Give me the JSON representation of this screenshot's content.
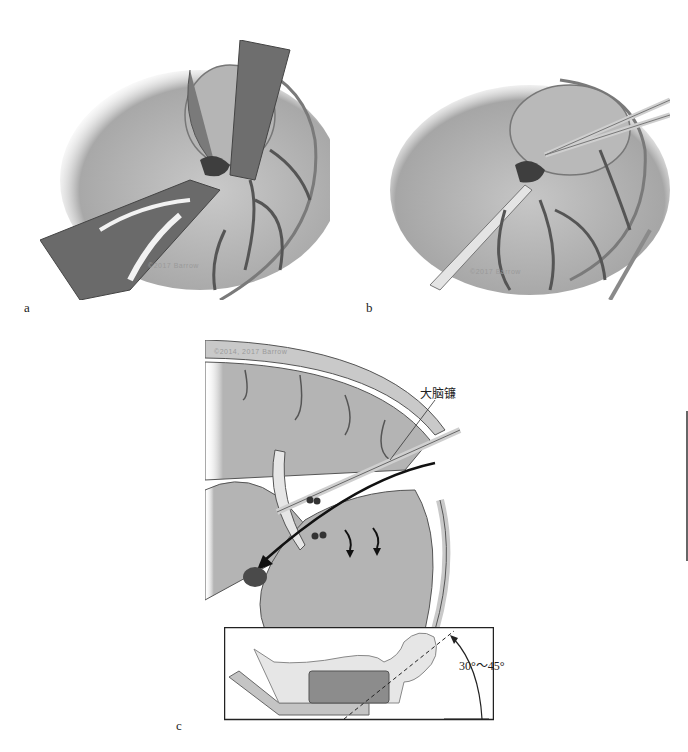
{
  "figure": {
    "panels": [
      {
        "id": "a",
        "label": "a",
        "description": "Surgical view: brain retracted with spatulas, lesion exposed among vessels",
        "credit": "©2017 Barrow"
      },
      {
        "id": "b",
        "label": "b",
        "description": "Surgical view: suction tube and microscissors dissecting lesion",
        "credit": "©2017 Barrow"
      },
      {
        "id": "c",
        "label": "c",
        "description": "Sagittal section showing interhemispheric trajectory with instruments and arrows toward lesion",
        "credit": "©2014, 2017 Barrow",
        "annotation": "大脑镰",
        "inset": {
          "description": "Patient positioning with head elevated",
          "angle_label": "30°～45°"
        }
      }
    ]
  },
  "colors": {
    "background": "#ffffff",
    "tissue": "#b8b8b8",
    "tissue_dark": "#8a8a8a",
    "vessel": "#5a5a5a",
    "instrument": "#d8d8d8",
    "lesion": "#4a4a4a",
    "outline": "#333333"
  }
}
